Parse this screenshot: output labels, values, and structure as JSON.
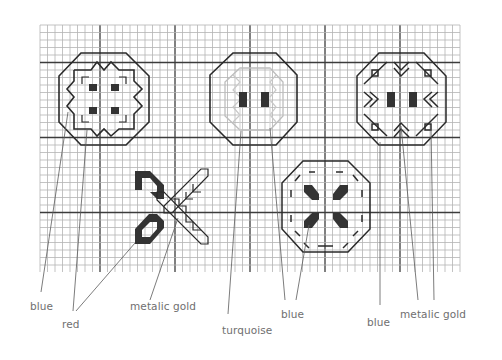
{
  "diagram": {
    "type": "cross-stitch-pattern",
    "grid": {
      "x0": 40,
      "y0": 25,
      "x1": 460,
      "y1": 272,
      "cell": 7.5,
      "major_every": 10
    },
    "colors": {
      "grid_minor": "#b4b4b4",
      "grid_major": "#3c3c3c",
      "outline": "#2a2a2a",
      "light_stitch": "#bdbdbd",
      "fill_dark": "#333333",
      "leader": "#5a5a5a",
      "label_text": "#6f6f6f"
    },
    "motifs": [
      {
        "id": "octagon-zigzag",
        "description": "octagon with zigzag inner frame and four dark squares"
      },
      {
        "id": "octagon-turquoise",
        "description": "octagon with light turquoise inner octagon and two dark bars"
      },
      {
        "id": "octagon-chevrons",
        "description": "octagon with chevrons, small diamonds and two dark bars"
      },
      {
        "id": "x-ribbon",
        "description": "two dark loops with an outlined diagonal ribbon forming an X"
      },
      {
        "id": "octagon-petals",
        "description": "octagon with dashed inner octagon and four dark diagonal petals"
      }
    ]
  },
  "labels": [
    {
      "id": "blue-1",
      "text": "blue",
      "x": 30,
      "y": 300
    },
    {
      "id": "red",
      "text": "red",
      "x": 62,
      "y": 318
    },
    {
      "id": "metalic-gold-1",
      "text": "metalic gold",
      "x": 130,
      "y": 300
    },
    {
      "id": "turquoise",
      "text": "turquoise",
      "x": 222,
      "y": 324
    },
    {
      "id": "blue-2",
      "text": "blue",
      "x": 281,
      "y": 308
    },
    {
      "id": "blue-3",
      "text": "blue",
      "x": 367,
      "y": 316
    },
    {
      "id": "metalic-gold-2",
      "text": "metalic gold",
      "x": 400,
      "y": 308
    }
  ]
}
